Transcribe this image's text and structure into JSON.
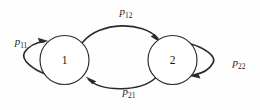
{
  "diagram": {
    "type": "markov-chain-state-transition-diagram",
    "background_color": "#fefefe",
    "stroke_color": "#2b2b2b",
    "states": [
      {
        "id": "state-1",
        "label": "1",
        "cx": 64.5,
        "cy": 60,
        "r": 24.5
      },
      {
        "id": "state-2",
        "label": "2",
        "cx": 172.5,
        "cy": 60,
        "r": 24.5
      }
    ],
    "transitions": [
      {
        "id": "p11",
        "from": "1",
        "to": "1",
        "kind": "self-loop",
        "symbol": "p",
        "subscript": "11",
        "label_x": 21,
        "label_y": 45
      },
      {
        "id": "p12",
        "from": "1",
        "to": "2",
        "kind": "arc-top",
        "symbol": "p",
        "subscript": "12",
        "label_x": 126,
        "label_y": 15
      },
      {
        "id": "p21",
        "from": "2",
        "to": "1",
        "kind": "arc-bottom",
        "symbol": "p",
        "subscript": "21",
        "label_x": 129,
        "label_y": 95
      },
      {
        "id": "p22",
        "from": "2",
        "to": "2",
        "kind": "self-loop",
        "symbol": "p",
        "subscript": "22",
        "label_x": 239,
        "label_y": 66
      }
    ]
  }
}
